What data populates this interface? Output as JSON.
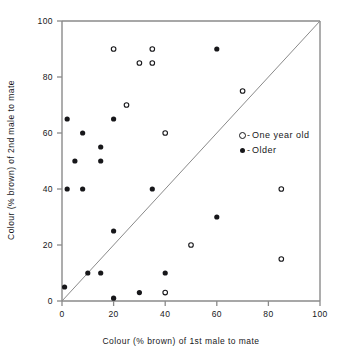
{
  "chart_data": {
    "type": "scatter",
    "title": "",
    "xlabel": "Colour (% brown) of  1st  male to mate",
    "ylabel": "Colour (% brown) of 2nd  male to mate",
    "xlim": [
      0,
      100
    ],
    "ylim": [
      0,
      100
    ],
    "xticks": [
      0,
      20,
      40,
      60,
      80,
      100
    ],
    "yticks": [
      0,
      20,
      40,
      60,
      80,
      100
    ],
    "xtick_labels": [
      "0",
      "20",
      "40",
      "60",
      "80",
      "100"
    ],
    "ytick_labels": [
      "0",
      "20",
      "40",
      "60",
      "80",
      "100"
    ],
    "grid": false,
    "legend_position": "middle-right",
    "reference_line": {
      "name": "y = x diagonal",
      "from": [
        0,
        0
      ],
      "to": [
        100,
        100
      ]
    },
    "series": [
      {
        "name": "One year old",
        "marker": "open-circle",
        "color": "#17171a",
        "points": [
          [
            20,
            90
          ],
          [
            35,
            90
          ],
          [
            30,
            85
          ],
          [
            35,
            85
          ],
          [
            25,
            70
          ],
          [
            70,
            75
          ],
          [
            40,
            60
          ],
          [
            85,
            40
          ],
          [
            50,
            20
          ],
          [
            85,
            15
          ],
          [
            40,
            3
          ]
        ]
      },
      {
        "name": "Older",
        "marker": "filled-circle",
        "color": "#17171a",
        "points": [
          [
            60,
            90
          ],
          [
            20,
            65
          ],
          [
            2,
            65
          ],
          [
            8,
            60
          ],
          [
            15,
            55
          ],
          [
            5,
            50
          ],
          [
            15,
            50
          ],
          [
            2,
            40
          ],
          [
            8,
            40
          ],
          [
            35,
            40
          ],
          [
            60,
            30
          ],
          [
            20,
            25
          ],
          [
            10,
            10
          ],
          [
            15,
            10
          ],
          [
            40,
            10
          ],
          [
            1,
            5
          ],
          [
            30,
            3
          ],
          [
            20,
            1
          ]
        ]
      }
    ]
  },
  "legend": {
    "entries": [
      {
        "symbol": "open-circle",
        "dash": "-",
        "label": "One  year old"
      },
      {
        "symbol": "filled-circle",
        "dash": "-",
        "label": "Older"
      }
    ]
  }
}
